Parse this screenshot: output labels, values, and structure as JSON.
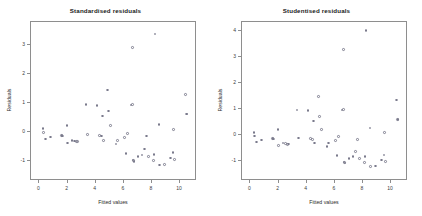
{
  "figure": {
    "background": "#ffffff",
    "point_color": "#7a7a8c",
    "axis_color": "#8e8e8e"
  },
  "chart_data": [
    {
      "type": "scatter",
      "title": "Standardised residuals",
      "xlabel": "Fitted values",
      "ylabel": "Residuals",
      "xlim": [
        -0.6,
        11.2
      ],
      "ylim": [
        -1.7,
        3.8
      ],
      "xticks": [
        0,
        2,
        4,
        6,
        8,
        10
      ],
      "yticks": [
        -1,
        0,
        1,
        2,
        3
      ],
      "grid": false,
      "legend": null,
      "x": [
        0.25,
        0.3,
        0.45,
        0.8,
        1.55,
        1.6,
        1.65,
        1.95,
        2.0,
        2.3,
        2.5,
        2.65,
        2.7,
        3.3,
        3.4,
        4.1,
        4.25,
        4.4,
        4.5,
        4.55,
        4.85,
        4.9,
        5.05,
        5.45,
        5.55,
        6.05,
        6.15,
        6.25,
        6.5,
        6.6,
        6.62,
        6.65,
        6.7,
        6.72,
        7.0,
        7.3,
        7.45,
        7.6,
        7.75,
        8.1,
        8.15,
        8.2,
        8.5,
        8.55,
        8.9,
        9.3,
        9.5,
        9.55,
        9.6,
        10.4,
        10.45,
        10.5
      ],
      "y": [
        0.12,
        -0.02,
        -0.25,
        -0.18,
        -0.12,
        -0.13,
        -0.14,
        0.22,
        -0.38,
        -0.3,
        -0.32,
        -0.34,
        -0.33,
        0.95,
        -0.1,
        0.92,
        -0.12,
        -0.15,
        0.55,
        -0.3,
        1.45,
        0.72,
        0.22,
        -0.42,
        -0.3,
        -0.2,
        -0.75,
        -0.05,
        0.93,
        0.95,
        2.92,
        -0.98,
        -1.0,
        -1.02,
        -0.85,
        -0.8,
        -0.6,
        -0.15,
        -0.85,
        -1.0,
        -0.78,
        3.38,
        0.25,
        -1.15,
        -1.12,
        -0.9,
        -0.72,
        0.08,
        -0.95,
        1.3,
        0.62,
        0.62
      ]
    },
    {
      "type": "scatter",
      "title": "Studentised residuals",
      "xlabel": "Fitted values",
      "ylabel": "Residuals",
      "xlim": [
        -0.6,
        11.2
      ],
      "ylim": [
        -1.75,
        4.35
      ],
      "xticks": [
        0,
        2,
        4,
        6,
        8,
        10
      ],
      "yticks": [
        -1,
        0,
        1,
        2,
        3,
        4
      ],
      "grid": false,
      "legend": null,
      "x": [
        0.25,
        0.3,
        0.45,
        0.8,
        1.55,
        1.6,
        1.65,
        1.95,
        2.0,
        2.3,
        2.5,
        2.65,
        2.7,
        3.3,
        3.4,
        4.1,
        4.25,
        4.4,
        4.5,
        4.55,
        4.85,
        4.9,
        5.05,
        5.45,
        5.55,
        6.05,
        6.15,
        6.25,
        6.5,
        6.6,
        6.62,
        6.65,
        6.7,
        6.72,
        7.0,
        7.3,
        7.45,
        7.6,
        7.75,
        8.1,
        8.15,
        8.2,
        8.5,
        8.55,
        8.9,
        9.3,
        9.5,
        9.55,
        9.6,
        10.4,
        10.45,
        10.5
      ],
      "y": [
        0.12,
        -0.02,
        -0.25,
        -0.18,
        -0.12,
        -0.13,
        -0.14,
        0.22,
        -0.38,
        -0.3,
        -0.32,
        -0.34,
        -0.33,
        0.98,
        -0.1,
        0.95,
        -0.12,
        -0.15,
        0.55,
        -0.3,
        1.5,
        0.72,
        0.22,
        -0.42,
        -0.3,
        -0.2,
        -0.78,
        -0.05,
        0.98,
        1.0,
        3.3,
        -1.02,
        -1.05,
        -1.06,
        -0.88,
        -0.82,
        -0.62,
        -0.15,
        -0.88,
        -1.05,
        -0.8,
        4.02,
        0.28,
        -1.2,
        -1.18,
        -0.95,
        -0.75,
        0.1,
        -1.0,
        1.35,
        0.62,
        0.62
      ]
    }
  ]
}
